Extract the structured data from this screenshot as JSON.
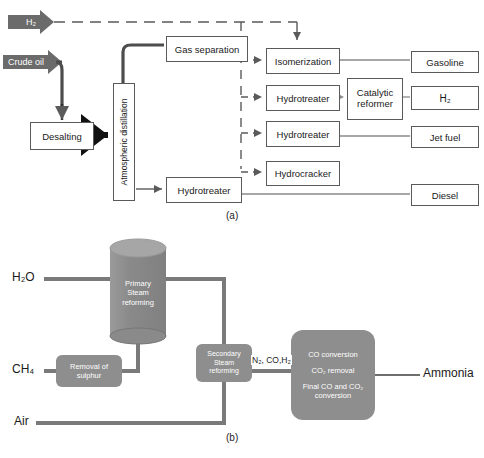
{
  "figure": {
    "panel_a": {
      "caption": "(a)",
      "title_hidden": "Petroleum refinery process flow",
      "feed_arrows": [
        {
          "label": "H2",
          "label_display": "H₂",
          "x": 8,
          "y": 14,
          "w": 46,
          "h": 16
        },
        {
          "label": "Crude oil",
          "label_display": "Crude oil",
          "x": 3,
          "y": 54,
          "w": 62,
          "h": 16
        }
      ],
      "boxes": [
        {
          "id": "desalting",
          "label": "Desalting",
          "x": 30,
          "y": 122,
          "w": 62,
          "h": 26,
          "orient": "h"
        },
        {
          "id": "atmospheric-distillation",
          "label": "Atmospheric distillation",
          "x": 113,
          "y": 83,
          "w": 20,
          "h": 116,
          "orient": "v"
        },
        {
          "id": "gas-separation",
          "label": "Gas separation",
          "x": 166,
          "y": 36,
          "w": 80,
          "h": 24,
          "orient": "h"
        },
        {
          "id": "hydrotreater-bottom",
          "label": "Hydrotreater",
          "x": 166,
          "y": 177,
          "w": 74,
          "h": 24,
          "orient": "h"
        },
        {
          "id": "isomerization",
          "label": "Isomerization",
          "x": 266,
          "y": 48,
          "w": 72,
          "h": 24,
          "orient": "h"
        },
        {
          "id": "hydrotreater-1",
          "label": "Hydrotreater",
          "x": 266,
          "y": 85,
          "w": 72,
          "h": 24,
          "orient": "h"
        },
        {
          "id": "hydrotreater-2",
          "label": "Hydrotreater",
          "x": 266,
          "y": 121,
          "w": 72,
          "h": 24,
          "orient": "h"
        },
        {
          "id": "hydrocracker",
          "label": "Hydrocracker",
          "x": 266,
          "y": 161,
          "w": 72,
          "h": 23,
          "orient": "h"
        },
        {
          "id": "catalytic-reformer",
          "label": "Catalytic reformer",
          "label_lines": [
            "Catalytic",
            "reformer"
          ],
          "x": 347,
          "y": 78,
          "w": 54,
          "h": 40,
          "orient": "h"
        }
      ],
      "products": [
        {
          "id": "gasoline",
          "label": "Gasoline",
          "x": 411,
          "y": 51,
          "w": 66,
          "h": 20
        },
        {
          "id": "h2-product",
          "label": "H2",
          "label_display": "H₂",
          "x": 411,
          "y": 86,
          "w": 66,
          "h": 22
        },
        {
          "id": "jet-fuel",
          "label": "Jet fuel",
          "x": 411,
          "y": 126,
          "w": 66,
          "h": 20
        },
        {
          "id": "diesel",
          "label": "Diesel",
          "x": 411,
          "y": 184,
          "w": 66,
          "h": 20
        }
      ]
    },
    "panel_b": {
      "caption": "(b)",
      "feeds": [
        {
          "id": "h2o-feed",
          "label": "H2O",
          "label_display": "H₂O",
          "x": 12,
          "y": 272
        },
        {
          "id": "ch4-feed",
          "label": "CH4",
          "label_display": "CH₄",
          "x": 12,
          "y": 371
        },
        {
          "id": "air-feed",
          "label": "Air",
          "x": 14,
          "y": 416
        }
      ],
      "units": [
        {
          "id": "primary-steam-reforming",
          "label_lines": [
            "Primary",
            "Steam",
            "reforming"
          ],
          "shape": "cylinder",
          "x": 110,
          "y": 238,
          "w": 56,
          "h": 104
        },
        {
          "id": "removal-of-sulphur",
          "label_lines": [
            "Removal of",
            "sulphur"
          ],
          "shape": "rounded-box",
          "x": 56,
          "y": 355,
          "w": 66,
          "h": 32
        },
        {
          "id": "secondary-steam-reforming",
          "label_lines": [
            "Secondary",
            "Steam",
            "reforming"
          ],
          "shape": "rounded-box",
          "x": 196,
          "y": 344,
          "w": 56,
          "h": 38
        },
        {
          "id": "conversion-removal",
          "label_lines": [
            "CO conversion",
            "CO2 removal",
            "Final CO and CO2",
            "conversion"
          ],
          "label_lines_display": [
            "CO conversion",
            "CO₂ removal",
            "Final CO and CO₂",
            "conversion"
          ],
          "shape": "rounded-box",
          "x": 291,
          "y": 330,
          "w": 84,
          "h": 90
        }
      ],
      "stream_labels": [
        {
          "id": "syngas-label",
          "label": "N2, CO,H2",
          "label_display": "N₂, CO,H₂",
          "x": 251,
          "y": 356
        }
      ],
      "products": [
        {
          "id": "ammonia-product",
          "label": "Ammonia",
          "x": 423,
          "y": 371
        }
      ]
    }
  },
  "colors": {
    "box_stroke": "#5a5a5a",
    "line": "#6e6e6e",
    "pipe": "#7a7a7a",
    "unit_fill": "#8e8e8e",
    "cylinder_fill": "#8f8f8f",
    "cylinder_top": "#a3a3a3",
    "arrow_fill": "#6b6b6b",
    "text": "#1c1c1c",
    "unit_text": "#ffffff"
  }
}
